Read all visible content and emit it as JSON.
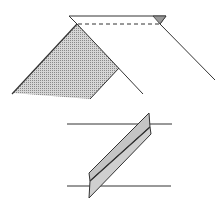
{
  "diagram": {
    "colors": {
      "stroke": "#333333",
      "shade": "#b8b8b8",
      "strip_fill": "#c4c4c4",
      "background": "#ffffff"
    },
    "top_figure": {
      "name": "folded-sheet",
      "fold_line_style": "dashed"
    },
    "bottom_figure": {
      "name": "folded-strip-between-lines"
    }
  }
}
